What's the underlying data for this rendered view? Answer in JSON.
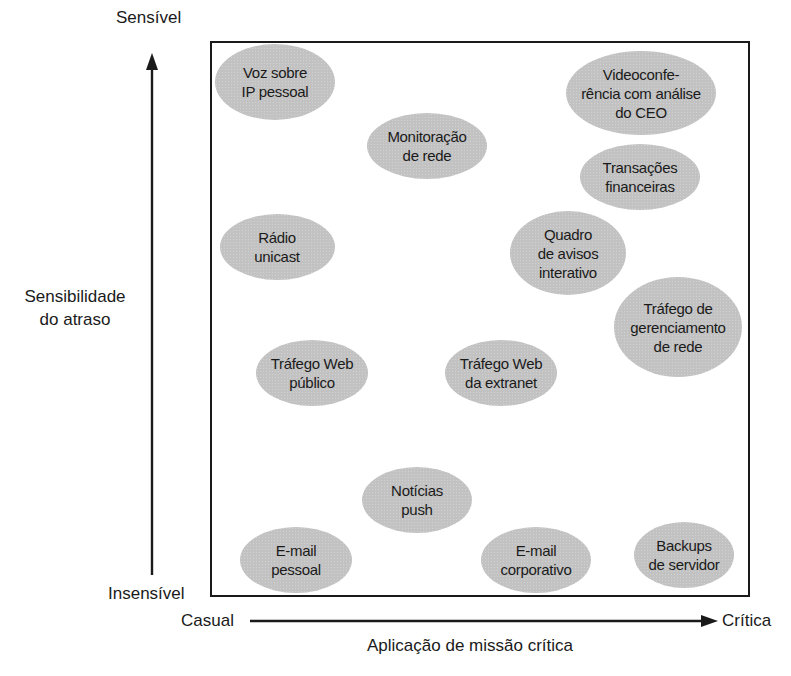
{
  "diagram": {
    "type": "qualitative-quadrant-chart",
    "y_axis": {
      "title": "Sensibilidade\ndo atraso",
      "top_label": "Sensível",
      "bottom_label": "Insensível"
    },
    "x_axis": {
      "title": "Aplicação de missão crítica",
      "left_label": "Casual",
      "right_label": "Crítica"
    },
    "bubble_color": "#c2c2c2",
    "line_color": "#1a1a1a",
    "items": [
      {
        "label": "Voz sobre\nIP pessoal",
        "cx": 275,
        "cy": 82,
        "w": 120,
        "h": 76
      },
      {
        "label": "Videoconfe-\nrência com análise\ndo CEO",
        "cx": 641,
        "cy": 93,
        "w": 150,
        "h": 84
      },
      {
        "label": "Monitoração\nde rede",
        "cx": 427,
        "cy": 146,
        "w": 120,
        "h": 66
      },
      {
        "label": "Transações\nfinanceiras",
        "cx": 640,
        "cy": 177,
        "w": 120,
        "h": 66
      },
      {
        "label": "Rádio\nunicast",
        "cx": 277,
        "cy": 247,
        "w": 115,
        "h": 66
      },
      {
        "label": "Quadro\nde avisos\ninterativo",
        "cx": 568,
        "cy": 253,
        "w": 116,
        "h": 84
      },
      {
        "label": "Tráfego de\ngerenciamento\nde rede",
        "cx": 678,
        "cy": 327,
        "w": 128,
        "h": 100
      },
      {
        "label": "Tráfego Web\npúblico",
        "cx": 312,
        "cy": 373,
        "w": 112,
        "h": 66
      },
      {
        "label": "Tráfego Web\nda extranet",
        "cx": 501,
        "cy": 373,
        "w": 112,
        "h": 66
      },
      {
        "label": "Notícias\npush",
        "cx": 417,
        "cy": 500,
        "w": 110,
        "h": 66
      },
      {
        "label": "E-mail\npessoal",
        "cx": 296,
        "cy": 560,
        "w": 112,
        "h": 66
      },
      {
        "label": "E-mail\ncorporativo",
        "cx": 536,
        "cy": 560,
        "w": 110,
        "h": 66
      },
      {
        "label": "Backups\nde servidor",
        "cx": 684,
        "cy": 555,
        "w": 100,
        "h": 66
      }
    ]
  }
}
